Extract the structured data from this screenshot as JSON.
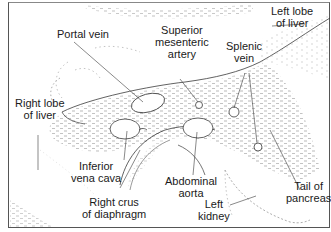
{
  "diagram": {
    "type": "anatomical cross-section (ultrasound transverse view of upper abdomen)",
    "colors": {
      "line": "#3a3a3a",
      "stipple": "#8a8a8a",
      "text": "#1a1a1a",
      "background": "#ffffff"
    },
    "labels": {
      "portal_vein": {
        "line1": "Portal vein"
      },
      "superior_mesenteric_artery": {
        "line1": "Superior",
        "line2": "mesenteric",
        "line3": "artery"
      },
      "splenic_vein": {
        "line1": "Splenic",
        "line2": "vein"
      },
      "left_lobe_of_liver": {
        "line1": "Left lobe",
        "line2": "of liver"
      },
      "right_lobe_of_liver": {
        "line1": "Right lobe",
        "line2": "of liver"
      },
      "inferior_vena_cava": {
        "line1": "Inferior",
        "line2": "vena cava"
      },
      "abdominal_aorta": {
        "line1": "Abdominal",
        "line2": "aorta"
      },
      "right_crus_of_diaphragm": {
        "line1": "Right crus",
        "line2": "of diaphragm"
      },
      "left_kidney": {
        "line1": "Left",
        "line2": "kidney"
      },
      "tail_of_pancreas": {
        "line1": "Tail of",
        "line2": "pancreas"
      }
    }
  }
}
